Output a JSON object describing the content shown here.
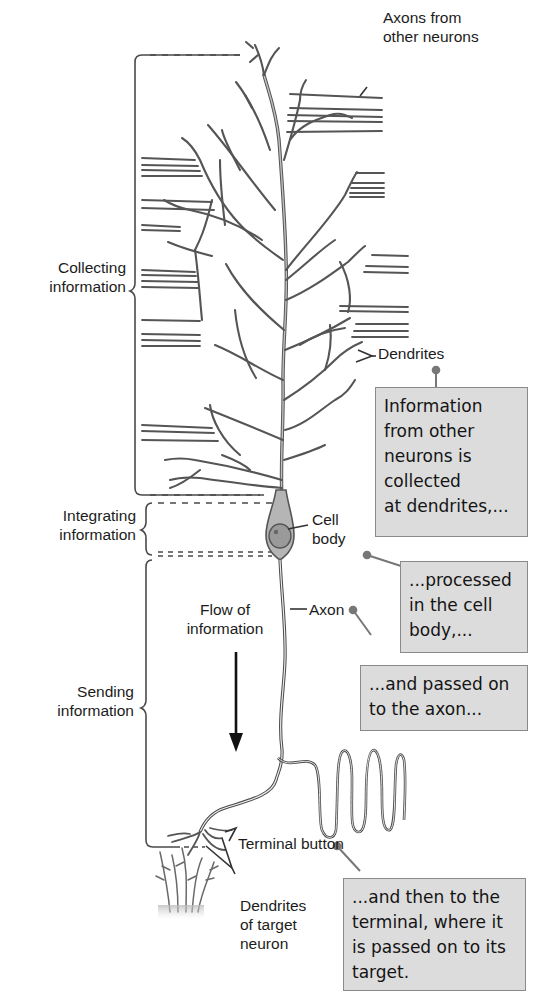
{
  "diagram": {
    "region_labels": {
      "collecting": "Collecting\ninformation",
      "integrating": "Integrating\ninformation",
      "sending": "Sending\ninformation"
    },
    "part_labels": {
      "axons_from_other": "Axons from\nother neurons",
      "dendrites": "Dendrites",
      "cell_body": "Cell\nbody",
      "axon": "Axon",
      "flow": "Flow of\ninformation",
      "terminal_button": "Terminal button",
      "target_dendrites": "Dendrites\nof target\nneuron"
    },
    "callouts": [
      {
        "id": "collected",
        "text": "Information\nfrom other\nneurons is\ncollected\nat dendrites,..."
      },
      {
        "id": "processed",
        "text": "...processed\nin the cell\nbody,..."
      },
      {
        "id": "axon",
        "text": "...and passed on\nto the axon..."
      },
      {
        "id": "terminal",
        "text": "...and then to the\nterminal, where it\nis passed on to its\ntarget."
      }
    ],
    "colors": {
      "line": "#555555",
      "neuron_fill": "#b8b8b8",
      "callout_bg": "#dcdcdc",
      "callout_border": "#8a8a8a",
      "cell_body": "#a6a6a6",
      "nucleus": "#8c8c8c"
    }
  }
}
